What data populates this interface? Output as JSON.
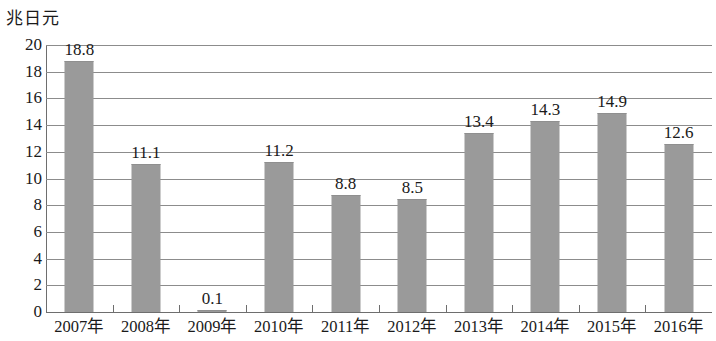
{
  "chart_data": {
    "type": "bar",
    "title": "",
    "unit_label": "兆日元",
    "xlabel": "",
    "ylabel": "兆日元",
    "categories": [
      "2007年",
      "2008年",
      "2009年",
      "2010年",
      "2011年",
      "2012年",
      "2013年",
      "2014年",
      "2015年",
      "2016年"
    ],
    "values": [
      18.8,
      11.1,
      0.1,
      11.2,
      8.8,
      8.5,
      13.4,
      14.3,
      14.9,
      12.6
    ],
    "value_labels": [
      "18.8",
      "11.1",
      "0.1",
      "11.2",
      "8.8",
      "8.5",
      "13.4",
      "14.3",
      "14.9",
      "12.6"
    ],
    "ylim": [
      0,
      20
    ],
    "ytick_step": 2,
    "ytick_labels": [
      "20",
      "18",
      "16",
      "14",
      "12",
      "10",
      "8",
      "6",
      "4",
      "2",
      "0"
    ],
    "grid": true,
    "legend": "none",
    "series_color": "#9a9a9a",
    "gridline_color": "#8c8c8c",
    "axis_color": "#6e6e6e"
  }
}
